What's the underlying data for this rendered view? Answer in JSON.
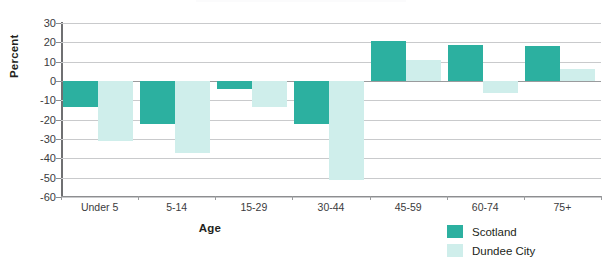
{
  "chart_data": {
    "type": "bar",
    "title": "",
    "xlabel": "Age",
    "ylabel": "Percent",
    "categories": [
      "Under 5",
      "5-14",
      "15-29",
      "30-44",
      "45-59",
      "60-74",
      "75+"
    ],
    "series": [
      {
        "name": "Scotland",
        "color": "#2cb0a0",
        "values": [
          -13.5,
          -22,
          -4,
          -22,
          20.5,
          18.5,
          18
        ]
      },
      {
        "name": "Dundee City",
        "color": "#cfeeeb",
        "values": [
          -31,
          -37,
          -13.5,
          -51,
          11,
          -6,
          6
        ]
      }
    ],
    "ylim": [
      -60,
      30
    ],
    "ytick_values": [
      30,
      20,
      10,
      0,
      -10,
      -20,
      -30,
      -40,
      -50,
      -60
    ],
    "ytick_labels": [
      "30",
      "20",
      "10",
      "0",
      "-10",
      "-20",
      "-30",
      "-40",
      "-50",
      "-60"
    ],
    "grid": true,
    "legend_position": "bottom-right"
  },
  "axes": {
    "y_title": "Percent",
    "x_title": "Age"
  },
  "legend": {
    "entries": [
      {
        "label": "Scotland",
        "color": "#2cb0a0"
      },
      {
        "label": "Dundee City",
        "color": "#cfeeeb"
      }
    ]
  }
}
